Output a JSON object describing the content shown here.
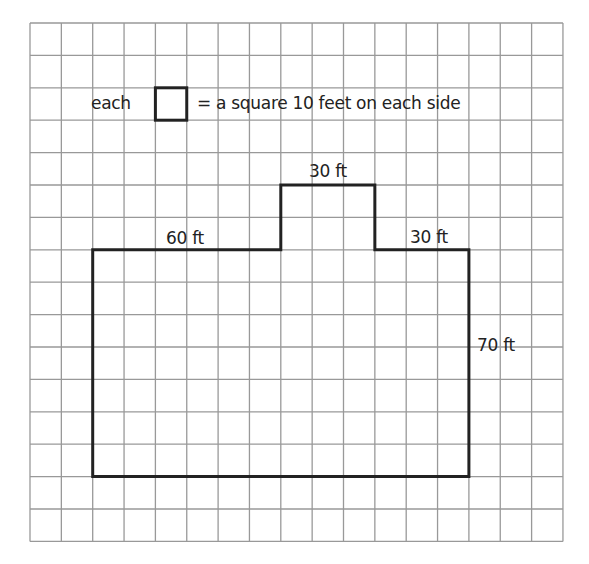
{
  "diagram": {
    "type": "floor-plan-grid",
    "grid": {
      "columns": 17,
      "rows": 16,
      "left": 30,
      "top": 23,
      "cell_w": 31.35,
      "cell_h": 32.4,
      "line_color": "#999999"
    },
    "legend": {
      "prefix": "each",
      "suffix": "= a square 10 feet on each side"
    },
    "shape": {
      "stroke": "#222222",
      "vertices_grid": [
        [
          2,
          7
        ],
        [
          8,
          7
        ],
        [
          8,
          5
        ],
        [
          11,
          5
        ],
        [
          11,
          7
        ],
        [
          14,
          7
        ],
        [
          14,
          14
        ],
        [
          2,
          14
        ]
      ]
    },
    "labels": {
      "top_left": "60 ft",
      "notch_top": "30 ft",
      "top_right": "30 ft",
      "right_side": "70 ft"
    }
  }
}
